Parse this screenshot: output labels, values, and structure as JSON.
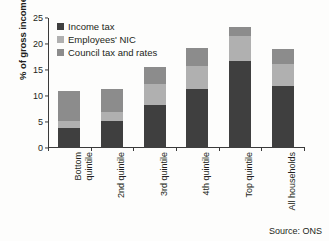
{
  "chart_data": {
    "type": "bar",
    "stacked": true,
    "title": "",
    "xlabel": "",
    "ylabel": "% of gross income",
    "ylim": [
      0,
      25
    ],
    "yticks": [
      0,
      5,
      10,
      15,
      20,
      25
    ],
    "grid": false,
    "legend_position": "top-left",
    "categories": [
      "Bottom\nquintile",
      "2nd quintile",
      "3rd quintile",
      "4th quintile",
      "Top quintile",
      "All households"
    ],
    "series": [
      {
        "name": "Income tax",
        "color": "#3f3f3f",
        "values": [
          3.8,
          5.1,
          8.2,
          11.3,
          16.7,
          11.9
        ]
      },
      {
        "name": "Employees' NIC",
        "color": "#b0b0b0",
        "values": [
          1.4,
          1.8,
          4.1,
          4.4,
          4.9,
          4.2
        ]
      },
      {
        "name": "Council tax and rates",
        "color": "#8c8c8c",
        "values": [
          5.8,
          4.4,
          3.3,
          3.6,
          1.6,
          2.9
        ]
      }
    ],
    "totals": [
      11.0,
      11.3,
      15.6,
      19.3,
      23.2,
      19.0
    ],
    "source": "Source: ONS"
  }
}
